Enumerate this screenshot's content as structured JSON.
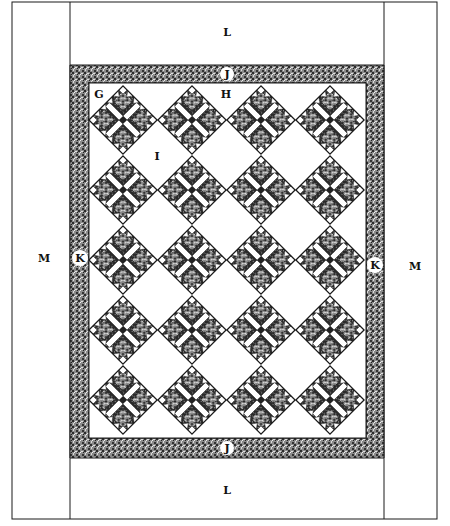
{
  "diagram": {
    "labels": {
      "top_border": "L",
      "bottom_border": "L",
      "left_border": "M",
      "right_border": "M",
      "top_inner_border": "J",
      "bottom_inner_border": "J",
      "left_inner_border": "K",
      "right_inner_border": "K",
      "block": "G",
      "setting_triangle": "H",
      "setting_square": "I"
    },
    "grid": {
      "columns": 4,
      "rows": 5
    },
    "colors": {
      "line": "#1a1a1a",
      "print_dark": "#3a3a3a",
      "print_light": "#bdbdbd",
      "background": "#ffffff"
    }
  }
}
